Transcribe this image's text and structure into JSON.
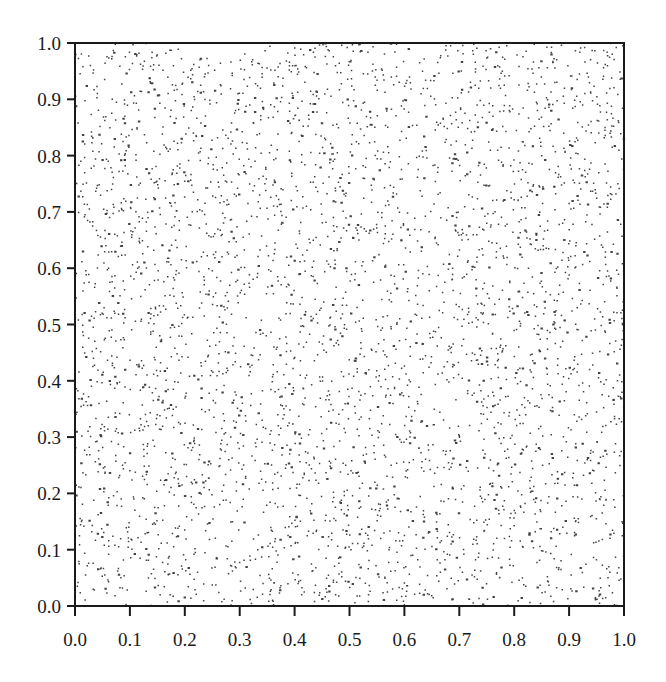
{
  "chart_data": {
    "type": "scatter",
    "title": "",
    "xlabel": "",
    "ylabel": "",
    "xlim": [
      0.0,
      1.0
    ],
    "ylim": [
      0.0,
      1.0
    ],
    "grid": false,
    "legend": null,
    "x_ticks": [
      "0.0",
      "0.1",
      "0.2",
      "0.3",
      "0.4",
      "0.5",
      "0.6",
      "0.7",
      "0.8",
      "0.9",
      "1.0"
    ],
    "y_ticks": [
      "0.0",
      "0.1",
      "0.2",
      "0.3",
      "0.4",
      "0.5",
      "0.6",
      "0.7",
      "0.8",
      "0.9",
      "1.0"
    ],
    "series": [
      {
        "name": "uniform random points",
        "distribution": "uniform on [0,1] x [0,1]",
        "approx_count": 4000,
        "marker": "small dot",
        "color": "#222222"
      }
    ]
  },
  "style": {
    "axis_color": "#1a1a1a",
    "point_color": "#222222",
    "background": "#ffffff"
  },
  "layout": {
    "plot_left": 75,
    "plot_top": 43,
    "plot_right": 624,
    "plot_bottom": 606,
    "seed": 20240607
  }
}
